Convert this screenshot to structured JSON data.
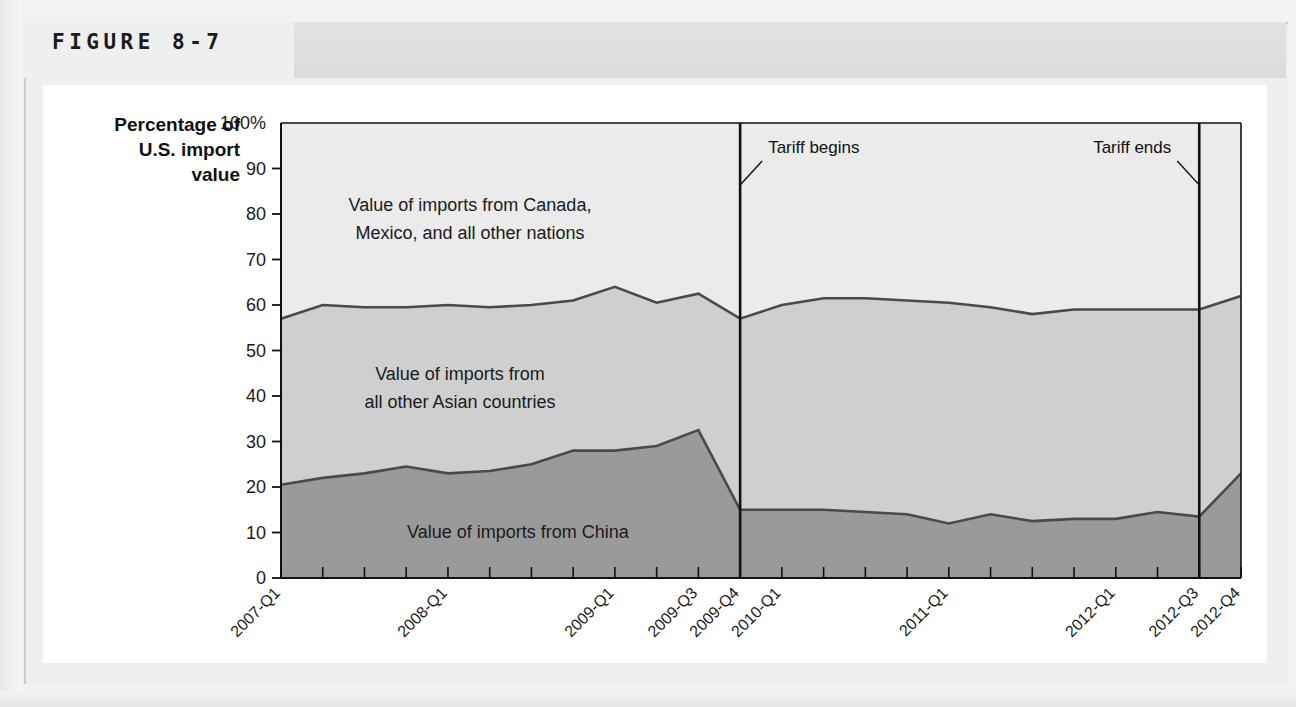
{
  "figure": {
    "title": "FIGURE 8-7"
  },
  "axis_title": {
    "line1": "Percentage of",
    "line2": "U.S. import",
    "line3": "value"
  },
  "area_labels": {
    "top_line1": "Value of imports from Canada,",
    "top_line2": "Mexico, and all other nations",
    "mid_line1": "Value of imports from",
    "mid_line2": "all other Asian countries",
    "bottom": "Value of imports from China"
  },
  "annotations": [
    {
      "name": "tariff-begins",
      "text": "Tariff begins",
      "at": "2009-Q4"
    },
    {
      "name": "tariff-ends",
      "text": "Tariff ends",
      "at": "2012-Q3"
    }
  ],
  "colors": {
    "china_area": "#9a9a9a",
    "other_asia_area": "#cfcfcf",
    "rest_of_world_area": "#ebebeb",
    "series_line": "#4a4a4a",
    "axis": "#111111",
    "panel": "#efefef",
    "title_band": "#dcdcdc",
    "card": "#ffffff"
  },
  "chart_data": {
    "type": "area",
    "title": "FIGURE 8-7",
    "xlabel": "",
    "ylabel": "Percentage of U.S. import value",
    "ylim": [
      0,
      100
    ],
    "yticks": [
      "0",
      "10",
      "20",
      "30",
      "40",
      "50",
      "60",
      "70",
      "80",
      "90",
      "100%"
    ],
    "ytick_values": [
      0,
      10,
      20,
      30,
      40,
      50,
      60,
      70,
      80,
      90,
      100
    ],
    "grid": false,
    "legend": "in-plot area labels",
    "stacked": true,
    "x": [
      "2007-Q1",
      "2007-Q2",
      "2007-Q3",
      "2007-Q4",
      "2008-Q1",
      "2008-Q2",
      "2008-Q3",
      "2008-Q4",
      "2009-Q1",
      "2009-Q2",
      "2009-Q3",
      "2009-Q4",
      "2010-Q1",
      "2010-Q2",
      "2010-Q3",
      "2010-Q4",
      "2011-Q1",
      "2011-Q2",
      "2011-Q3",
      "2011-Q4",
      "2012-Q1",
      "2012-Q2",
      "2012-Q3",
      "2012-Q4"
    ],
    "xtick_labels_shown": [
      "2007-Q1",
      "2008-Q1",
      "2009-Q1",
      "2009-Q3",
      "2009-Q4",
      "2010-Q1",
      "2011-Q1",
      "2012-Q1",
      "2012-Q3",
      "2012-Q4"
    ],
    "series": [
      {
        "name": "Value of imports from China",
        "color": "#9a9a9a",
        "values": [
          20.5,
          22.0,
          23.0,
          24.5,
          23.0,
          23.5,
          25.0,
          28.0,
          28.0,
          29.0,
          32.5,
          15.0,
          15.0,
          15.0,
          14.5,
          14.0,
          12.0,
          14.0,
          12.5,
          13.0,
          13.0,
          14.5,
          13.5,
          23.0
        ]
      },
      {
        "name": "Value of imports from all other Asian countries",
        "color": "#cfcfcf",
        "values": [
          36.5,
          38.0,
          36.5,
          35.0,
          37.0,
          36.0,
          35.0,
          33.0,
          36.0,
          31.5,
          30.0,
          42.0,
          45.0,
          46.5,
          47.0,
          47.0,
          48.5,
          45.5,
          45.5,
          46.0,
          46.0,
          44.5,
          45.5,
          39.0
        ]
      },
      {
        "name": "Value of imports from Canada, Mexico, and all other nations",
        "color": "#ebebeb",
        "values": [
          43.0,
          40.0,
          40.5,
          40.5,
          40.0,
          40.5,
          40.0,
          39.0,
          36.0,
          39.5,
          37.5,
          43.0,
          40.0,
          38.5,
          38.5,
          39.0,
          39.5,
          40.5,
          42.0,
          41.0,
          41.0,
          41.0,
          41.0,
          38.0
        ]
      }
    ],
    "cumulative_upper_china": [
      20.5,
      22.0,
      23.0,
      24.5,
      23.0,
      23.5,
      25.0,
      28.0,
      28.0,
      29.0,
      32.5,
      15.0,
      15.0,
      15.0,
      14.5,
      14.0,
      12.0,
      14.0,
      12.5,
      13.0,
      13.0,
      14.5,
      13.5,
      23.0
    ],
    "cumulative_upper_asia": [
      57.0,
      60.0,
      59.5,
      59.5,
      60.0,
      59.5,
      60.0,
      61.0,
      64.0,
      60.5,
      62.5,
      57.0,
      60.0,
      61.5,
      61.5,
      61.0,
      60.5,
      59.5,
      58.0,
      59.0,
      59.0,
      59.0,
      59.0,
      62.0
    ],
    "annotations": [
      {
        "text": "Tariff begins",
        "x": "2009-Q4"
      },
      {
        "text": "Tariff ends",
        "x": "2012-Q3"
      }
    ]
  }
}
